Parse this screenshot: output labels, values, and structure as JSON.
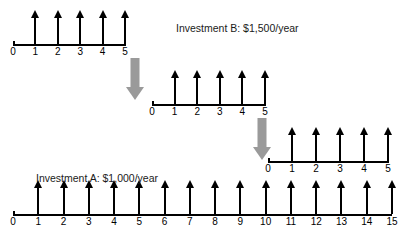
{
  "figure": {
    "type": "cash-flow-diagram",
    "background_color": "#ffffff",
    "line_color": "#000000",
    "transfer_arrow_color": "#9a9a9a"
  },
  "captions": {
    "investment_b": "Investment B: $1,500/year",
    "investment_a": "Investment A: $1,000/year"
  },
  "timelines": [
    {
      "id": "timeline-b-1",
      "label": "Investment B first 5-year cycle",
      "tick_labels": [
        "0",
        "1",
        "2",
        "3",
        "4",
        "5"
      ],
      "cash_flow_periods": [
        1,
        2,
        3,
        4,
        5
      ],
      "cash_flow_direction": "up",
      "cash_flow_amount": "$1,500/year"
    },
    {
      "id": "timeline-b-2",
      "label": "Investment B second 5-year cycle",
      "tick_labels": [
        "0",
        "1",
        "2",
        "3",
        "4",
        "5"
      ],
      "cash_flow_periods": [
        1,
        2,
        3,
        4,
        5
      ],
      "cash_flow_direction": "up",
      "cash_flow_amount": "$1,500/year"
    },
    {
      "id": "timeline-b-3",
      "label": "Investment B third 5-year cycle",
      "tick_labels": [
        "0",
        "1",
        "2",
        "3",
        "4",
        "5"
      ],
      "cash_flow_periods": [
        1,
        2,
        3,
        4,
        5
      ],
      "cash_flow_direction": "up",
      "cash_flow_amount": "$1,500/year"
    },
    {
      "id": "timeline-a",
      "label": "Investment A fifteen-year timeline",
      "tick_labels": [
        "0",
        "1",
        "2",
        "3",
        "4",
        "5",
        "6",
        "7",
        "8",
        "9",
        "10",
        "11",
        "12",
        "13",
        "14",
        "15"
      ],
      "cash_flow_periods": [
        1,
        2,
        3,
        4,
        5,
        6,
        7,
        8,
        9,
        10,
        11,
        12,
        13,
        14,
        15
      ],
      "cash_flow_direction": "up",
      "cash_flow_amount": "$1,000/year"
    }
  ],
  "transfer_arrows": [
    {
      "id": "transfer-arrow-1",
      "from": "end of cycle 1",
      "to": "start of cycle 2"
    },
    {
      "id": "transfer-arrow-2",
      "from": "end of cycle 2",
      "to": "start of cycle 3"
    }
  ],
  "chart_data": {
    "type": "bar",
    "xlabel": "Year",
    "ylabel": "Annual cash flow",
    "series": [
      {
        "name": "Investment A: $1,000/year",
        "x": [
          1,
          2,
          3,
          4,
          5,
          6,
          7,
          8,
          9,
          10,
          11,
          12,
          13,
          14,
          15
        ],
        "values": [
          1000,
          1000,
          1000,
          1000,
          1000,
          1000,
          1000,
          1000,
          1000,
          1000,
          1000,
          1000,
          1000,
          1000,
          1000
        ]
      },
      {
        "name": "Investment B: $1,500/year",
        "x": [
          1,
          2,
          3,
          4,
          5,
          6,
          7,
          8,
          9,
          10,
          11,
          12,
          13,
          14,
          15
        ],
        "values": [
          1500,
          1500,
          1500,
          1500,
          1500,
          1500,
          1500,
          1500,
          1500,
          1500,
          1500,
          1500,
          1500,
          1500,
          1500
        ]
      }
    ]
  }
}
